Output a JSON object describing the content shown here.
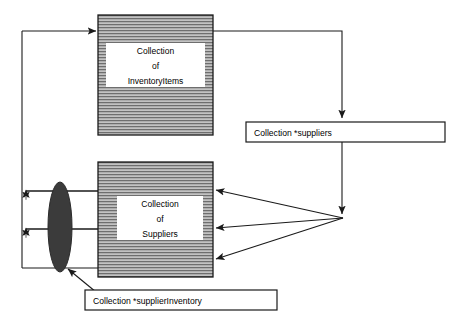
{
  "diagram": {
    "canvas": {
      "width": 454,
      "height": 325,
      "background": "#ffffff"
    },
    "colors": {
      "stroke": "#1a1a1a",
      "hatch_fill": "#b3b3b3",
      "hatch_line": "#4d4d4d",
      "ellipse_fill": "#3b3b3b",
      "box_fill": "#ffffff",
      "text": "#000000"
    },
    "nodes": {
      "inventory_box": {
        "name": "Collection of InventoryItems",
        "lines": [
          "Collection",
          "of",
          "InventoryItems"
        ],
        "x": 98,
        "y": 15,
        "width": 115,
        "height": 120,
        "style": "horizontal-hatch"
      },
      "suppliers_box": {
        "name": "Collection of Suppliers",
        "lines": [
          "Collection",
          "of",
          "Suppliers"
        ],
        "x": 98,
        "y": 162,
        "width": 115,
        "height": 115,
        "style": "horizontal-hatch"
      },
      "suppliers_pointer": {
        "label": "Collection *suppliers",
        "x": 246,
        "y": 122,
        "width": 199,
        "height": 20,
        "style": "plain-box"
      },
      "supplier_inventory_pointer": {
        "label": "Collection *supplierInventory",
        "x": 85,
        "y": 290,
        "width": 192,
        "height": 20,
        "style": "plain-box"
      },
      "supplier_inventory_ellipse": {
        "name": "supplierInventory collection ellipse",
        "cx": 60,
        "cy": 227,
        "rx": 12,
        "ry": 45,
        "style": "filled-ellipse"
      }
    },
    "edges": [
      {
        "id": "e1",
        "from": "inventory-box-right",
        "to": "suppliers-pointer-box-top",
        "arrow": "down"
      },
      {
        "id": "e2",
        "from": "suppliers-pointer-box-bottom",
        "to": "fan-hub",
        "arrow": "down"
      },
      {
        "id": "e3",
        "from": "fan-hub",
        "to": "suppliers-box-right-upper",
        "arrow": "left"
      },
      {
        "id": "e4",
        "from": "fan-hub",
        "to": "suppliers-box-right-middle",
        "arrow": "left"
      },
      {
        "id": "e5",
        "from": "fan-hub",
        "to": "suppliers-box-right-lower",
        "arrow": "left"
      },
      {
        "id": "e6",
        "from": "left-bus",
        "to": "inventory-box-left",
        "arrow": "right"
      },
      {
        "id": "e7",
        "from": "supplier-inventory-row-upper",
        "to": "left-bus-upper",
        "arrow": "up"
      },
      {
        "id": "e8",
        "from": "supplier-inventory-row-middle",
        "to": "left-bus-lower",
        "arrow": "up"
      },
      {
        "id": "e9",
        "from": "supplier-inventory-pointer-box",
        "to": "supplier-inventory-ellipse",
        "arrow": "up-left"
      }
    ]
  }
}
